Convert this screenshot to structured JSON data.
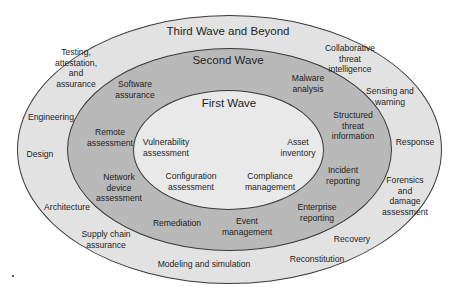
{
  "diagram": {
    "type": "concentric-ellipses",
    "colors": {
      "outer": "#e2e2e2",
      "middle": "#b9b9b9",
      "inner": "#e9e9e9",
      "border": "#3a3a3a"
    },
    "waves": [
      {
        "title": "Third Wave and Beyond",
        "items": [
          "Testing,\nattestation,\nand\nassurance",
          "Engineering",
          "Design",
          "Architecture",
          "Supply chain\nassurance",
          "Modeling and simulation",
          "Reconstitution",
          "Recovery",
          "Forensics\nand\ndamage\nassessment",
          "Response",
          "Sensing and\nwarning",
          "Collaborative\nthreat\nintelligence"
        ]
      },
      {
        "title": "Second Wave",
        "items": [
          "Software\nassurance",
          "Remote\nassessment",
          "Network\ndevice\nassessment",
          "Remediation",
          "Event\nmanagement",
          "Enterprise\nreporting",
          "Incident\nreporting",
          "Structured\nthreat\ninformation",
          "Malware\nanalysis"
        ]
      },
      {
        "title": "First Wave",
        "items": [
          "Vulnerability\nassessment",
          "Asset\ninventory",
          "Configuration\nassessment",
          "Compliance\nmanagement"
        ]
      }
    ]
  }
}
